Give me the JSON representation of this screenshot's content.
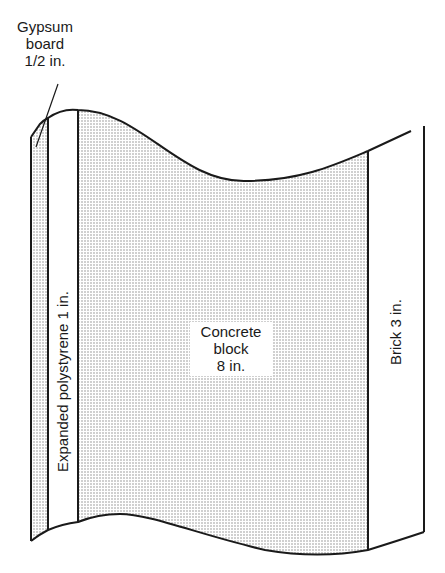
{
  "diagram": {
    "layers": [
      {
        "id": "gypsum",
        "name": "Gypsum board",
        "thickness": "1/2 in.",
        "fill": "dotted"
      },
      {
        "id": "polystyrene",
        "name": "Expanded polystyrene",
        "thickness": "1 in.",
        "fill": "white"
      },
      {
        "id": "concrete",
        "name": "Concrete block",
        "thickness": "8 in.",
        "fill": "dotted"
      },
      {
        "id": "brick",
        "name": "Brick",
        "thickness": "3 in.",
        "fill": "white"
      }
    ],
    "labels": {
      "gypsum": {
        "line1": "Gypsum",
        "line2": "board",
        "line3": "1/2 in."
      },
      "polystyrene": "Expanded polystyrene 1 in.",
      "concrete": {
        "line1": "Concrete",
        "line2": "block",
        "line3": "8 in."
      },
      "brick": "Brick 3 in."
    },
    "colors": {
      "line": "#1a1a1a",
      "dot": "#8a8a8a",
      "background": "#ffffff"
    }
  }
}
